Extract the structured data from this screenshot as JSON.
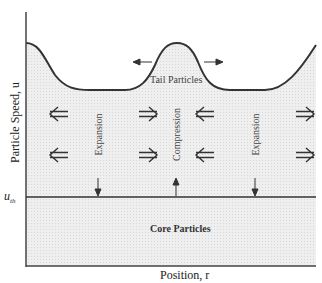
{
  "diagram": {
    "y_axis_label": "Particle Speed, u",
    "x_axis_label": "Position, r",
    "threshold_label": "u",
    "threshold_subscript": "th",
    "regions": {
      "upper": "Tail Particles",
      "lower": "Core Particles"
    },
    "zones": [
      "Expansion",
      "Compression",
      "Expansion"
    ],
    "colors": {
      "fill": "#ececec",
      "line": "#333333"
    }
  }
}
